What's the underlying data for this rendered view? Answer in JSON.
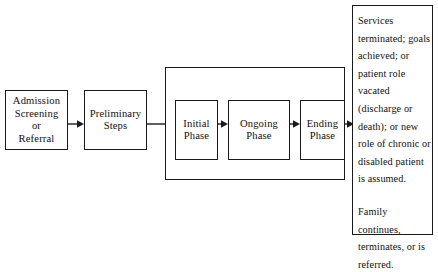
{
  "diagram": {
    "background_color": "#ffffff",
    "line_color": "#1a1a1a",
    "nodes": {
      "admission": {
        "label": "Admission\nScreening\nor\nReferral"
      },
      "preliminary": {
        "label": "Preliminary\nSteps"
      },
      "initial_phase": {
        "label": "Initial\nPhase"
      },
      "ongoing_phase": {
        "label": "Ongoing\nPhase"
      },
      "ending_phase": {
        "label": "Ending\nPhase"
      },
      "outcome": {
        "paragraph_1": "Services terminated; goals achieved; or patient role vacated (discharge or death); or new role of chronic or disabled patient is assumed.",
        "paragraph_2": "Family continues, terminates, or is referred."
      }
    },
    "edges": [
      {
        "name": "admission-to-preliminary",
        "from": "admission",
        "to": "preliminary",
        "style": "arrow"
      },
      {
        "name": "preliminary-to-initial",
        "from": "preliminary",
        "to": "initial_phase",
        "style": "arrow"
      },
      {
        "name": "initial-to-ongoing",
        "from": "initial_phase",
        "to": "ongoing_phase",
        "style": "arrow"
      },
      {
        "name": "ongoing-to-ending",
        "from": "ongoing_phase",
        "to": "ending_phase",
        "style": "arrow"
      },
      {
        "name": "ending-to-outcome",
        "from": "ending_phase",
        "to": "outcome",
        "style": "arrow"
      }
    ]
  }
}
